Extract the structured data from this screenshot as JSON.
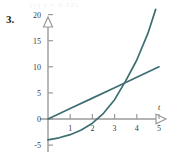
{
  "figure": {
    "problem_number": "3.",
    "header_faint_text": "(c)  x = 0.125",
    "curve_color": "#3d6e72",
    "axis_color": "#9a9a9a",
    "text_color": "#3a3a3a"
  },
  "chart_data": {
    "type": "line",
    "title": "",
    "xlabel": "t",
    "ylabel": "",
    "xlim": [
      -0.35,
      5.6
    ],
    "ylim": [
      -5.6,
      22.5
    ],
    "grid": false,
    "legend": "none",
    "xticks": [
      "1",
      "2",
      "3",
      "4",
      "5"
    ],
    "xtick_values": [
      1,
      2,
      3,
      4,
      5
    ],
    "yticks": [
      "-5",
      "0",
      "5",
      "10",
      "15",
      "20"
    ],
    "ytick_values": [
      -5,
      0,
      5,
      10,
      15,
      20
    ],
    "x_axis_arrow": true,
    "y_axis_arrow": true,
    "intersection": {
      "x": 3.2,
      "y": 6.6
    },
    "series": [
      {
        "name": "linear",
        "kind": "straight-line",
        "x": [
          0,
          1,
          2,
          3,
          4,
          5
        ],
        "values": [
          0,
          2,
          4,
          6,
          8,
          10
        ]
      },
      {
        "name": "exponential",
        "kind": "curve",
        "x": [
          0,
          0.5,
          1,
          1.5,
          2,
          2.5,
          3,
          3.5,
          4,
          4.5,
          4.85
        ],
        "values": [
          -4,
          -3.6,
          -3,
          -2.1,
          -0.8,
          1.1,
          3.7,
          7.3,
          11.3,
          16.4,
          21
        ]
      }
    ]
  }
}
